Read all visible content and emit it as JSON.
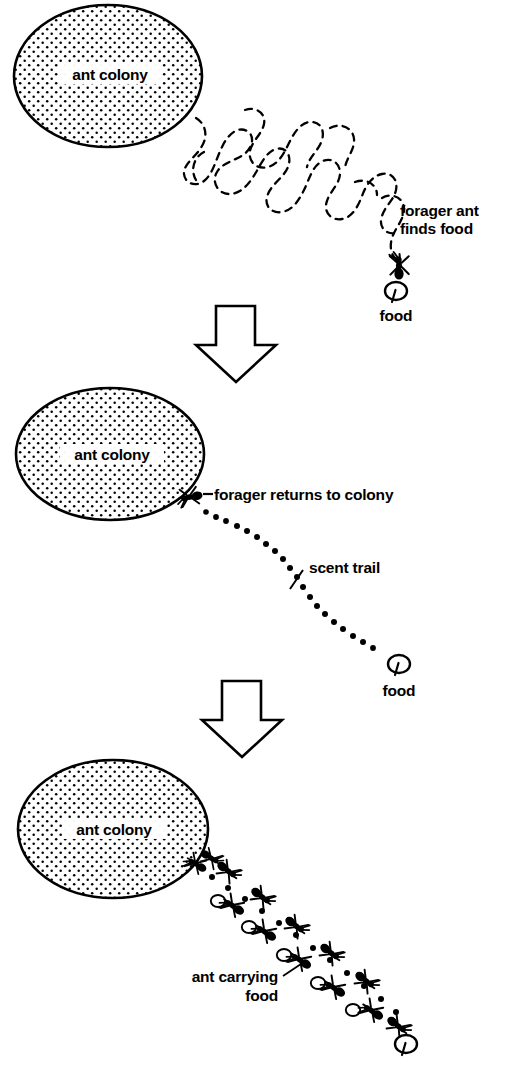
{
  "figure": {
    "background_color": "#ffffff",
    "ink_color": "#000000",
    "panel_count": 3
  },
  "panels": [
    {
      "id": "panel-1",
      "stage_label": "forager ant finds food",
      "colony_label": "ant colony",
      "labels": {
        "colony": "ant colony",
        "forager_line1": "forager ant",
        "forager_line2": "finds food",
        "food": "food"
      },
      "path_type": "random-walk-dashed",
      "description_of_path": "winding dashed meandering search path from colony to food"
    },
    {
      "id": "panel-2",
      "stage_label": "forager returns to colony",
      "colony_label": "ant colony",
      "labels": {
        "colony": "ant colony",
        "forager_returns": "forager returns to colony",
        "scent_trail": "scent trail",
        "food": "food"
      },
      "path_type": "dotted-scent-trail",
      "description_of_path": "curved line of round dots from food back to colony"
    },
    {
      "id": "panel-3",
      "stage_label": "ant carrying food",
      "colony_label": "ant colony",
      "labels": {
        "colony": "ant colony",
        "carrying_line1": "ant carrying",
        "carrying_line2": "food",
        "food": ""
      },
      "path_type": "ant-column-on-dotted-trail",
      "description_of_path": "double column of ants, several carrying food, following the dotted trail"
    }
  ],
  "arrows": [
    {
      "name": "arrow-panel1-to-panel2",
      "direction": "down",
      "style": "hollow-block-arrow"
    },
    {
      "name": "arrow-panel2-to-panel3",
      "direction": "down",
      "style": "hollow-block-arrow"
    }
  ],
  "icons": {
    "ant": "ant-icon",
    "food": "food-icon",
    "arrow_down": "arrow-down-icon",
    "colony": "colony-ellipse-icon",
    "scent_dot": "scent-dot-icon"
  }
}
